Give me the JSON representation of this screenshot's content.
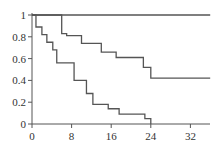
{
  "chart_data": {
    "type": "line",
    "subtype": "step (Kaplan-Meier style survival curves)",
    "title": "",
    "xlabel": "",
    "ylabel": "",
    "xlim": [
      0,
      36
    ],
    "ylim": [
      0,
      1
    ],
    "x_ticks": [
      0,
      8,
      16,
      24,
      32
    ],
    "y_ticks": [
      0,
      0.2,
      0.4,
      0.6,
      0.8,
      1
    ],
    "x_tick_labels": [
      "0",
      "8",
      "16",
      "24",
      "32"
    ],
    "y_tick_labels": [
      "0",
      "0.2",
      "0.4",
      "0.6",
      "0.8",
      "1"
    ],
    "grid": false,
    "legend": null,
    "reference_line": {
      "y": 1,
      "x_range": [
        0,
        36
      ]
    },
    "series": [
      {
        "name": "upper curve",
        "steps": [
          {
            "x": 0,
            "y": 1.0
          },
          {
            "x": 6,
            "y": 0.83
          },
          {
            "x": 7,
            "y": 0.81
          },
          {
            "x": 10,
            "y": 0.74
          },
          {
            "x": 14,
            "y": 0.66
          },
          {
            "x": 17,
            "y": 0.61
          },
          {
            "x": 22.5,
            "y": 0.52
          },
          {
            "x": 24,
            "y": 0.42
          },
          {
            "x": 36,
            "y": 0.42
          }
        ]
      },
      {
        "name": "lower curve",
        "steps": [
          {
            "x": 0,
            "y": 1.0
          },
          {
            "x": 0.8,
            "y": 0.89
          },
          {
            "x": 2,
            "y": 0.82
          },
          {
            "x": 3,
            "y": 0.75
          },
          {
            "x": 4.2,
            "y": 0.68
          },
          {
            "x": 5,
            "y": 0.56
          },
          {
            "x": 8.5,
            "y": 0.4
          },
          {
            "x": 11,
            "y": 0.28
          },
          {
            "x": 12.3,
            "y": 0.18
          },
          {
            "x": 15.4,
            "y": 0.14
          },
          {
            "x": 17.6,
            "y": 0.09
          },
          {
            "x": 22.8,
            "y": 0.05
          },
          {
            "x": 24,
            "y": 0.0
          }
        ]
      }
    ]
  },
  "layout": {
    "plot_left_px": 32,
    "plot_right_px": 210,
    "plot_top_px": 15,
    "plot_bottom_px": 124,
    "line_color": "#555555"
  }
}
